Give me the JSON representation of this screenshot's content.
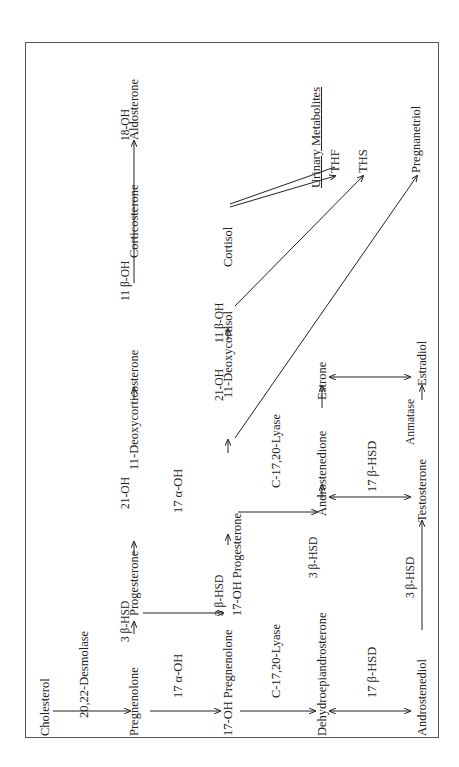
{
  "diagram": {
    "orientation": "rotated 90 degrees counterclockwise",
    "compounds": {
      "cholesterol": "Cholesterol",
      "pregnenolone": "Pregnenolone",
      "progesterone": "Progesterone",
      "deoxycorticosterone": "11-Deoxycorticosterone",
      "corticosterone": "Corticosterone",
      "aldosterone": "Aldosterone",
      "oh17_pregnenolone": "17-OH Pregnenolone",
      "oh17_progesterone": "17-OH Progesterone",
      "deoxycortisol": "11-Deoxycortisol",
      "cortisol": "Cortisol",
      "dhea": "Dehydroepiandrosterone",
      "androstenedione": "Androstenedione",
      "estrone": "Estrone",
      "androstenediol": "Androstenediol",
      "testosterone": "Testosterone",
      "estradiol": "Estradiol"
    },
    "enzymes": {
      "desmolase": "20,22-Desmolase",
      "hsd3b_1": "3 β-HSD",
      "hsd3b_2": "3 β-HSD",
      "hsd3b_3": "3 β-HSD",
      "hsd3b_4": "3 β-HSD",
      "oh21_1": "21-OH",
      "oh21_2": "21-OH",
      "oh11b_1": "11 β-OH",
      "oh11b_2": "11 β-OH",
      "oh18": "18-OH",
      "oh17a_1": "17 α-OH",
      "oh17a_2": "17 α-OH",
      "lyase_1": "C-17,20-Lyase",
      "lyase_2": "C-17,20-Lyase",
      "hsd17b_1": "17 β-HSD",
      "hsd17b_2": "17 β-HSD",
      "aromatase": "Anmatase"
    },
    "urinary": {
      "heading": "Urinary Metabolites",
      "thf": "THF",
      "ths": "THS",
      "pregnanetriol": "Pregnanetriol"
    },
    "colors": {
      "line": "#222222",
      "frame": "#555555",
      "background": "#ffffff"
    }
  }
}
